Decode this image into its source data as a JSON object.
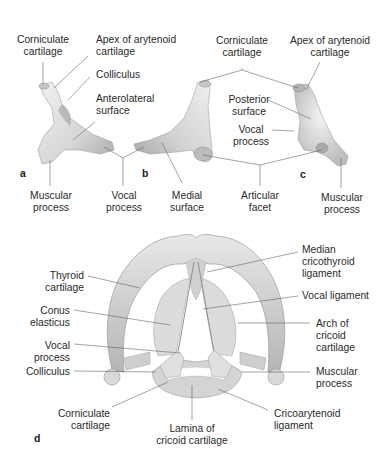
{
  "figure": {
    "panels": {
      "a": {
        "letter": "a"
      },
      "b": {
        "letter": "b"
      },
      "c": {
        "letter": "c"
      },
      "d": {
        "letter": "d"
      }
    },
    "labels": {
      "a_corniculate": "Corniculate\ncartilage",
      "a_apex": "Apex of arytenoid\ncartilage",
      "a_colliculus": "Colliculus",
      "a_anterolateral": "Anterolateral\nsurface",
      "a_muscular": "Muscular\nprocess",
      "ab_vocal": "Vocal\nprocess",
      "b_medial": "Medial\nsurface",
      "bc_corniculate": "Corniculate\ncartilage",
      "c_apex": "Apex of arytenoid\ncartilage",
      "c_posterior": "Posterior\nsurface",
      "c_vocal": "Vocal\nprocess",
      "bc_articular": "Articular\nfacet",
      "c_muscular": "Muscular\nprocess",
      "d_thyroid": "Thyroid\ncartilage",
      "d_conus": "Conus\nelasticus",
      "d_vocal_process": "Vocal\nprocess",
      "d_colliculus": "Colliculus",
      "d_corniculate": "Corniculate\ncartilage",
      "d_lamina": "Lamina of\ncricoid cartilage",
      "d_median": "Median\ncricothyroid\nligament",
      "d_vocal_ligament": "Vocal ligament",
      "d_arch": "Arch of\ncricoid\ncartilage",
      "d_muscular": "Muscular\nprocess",
      "d_cricoarytenoid": "Cricoarytenoid\nligament"
    },
    "colors": {
      "cartilage_light": "#ececec",
      "cartilage_mid": "#cfcfcf",
      "cartilage_dark": "#9a9a9a",
      "leader": "#555555",
      "text": "#2a2a2a"
    }
  }
}
